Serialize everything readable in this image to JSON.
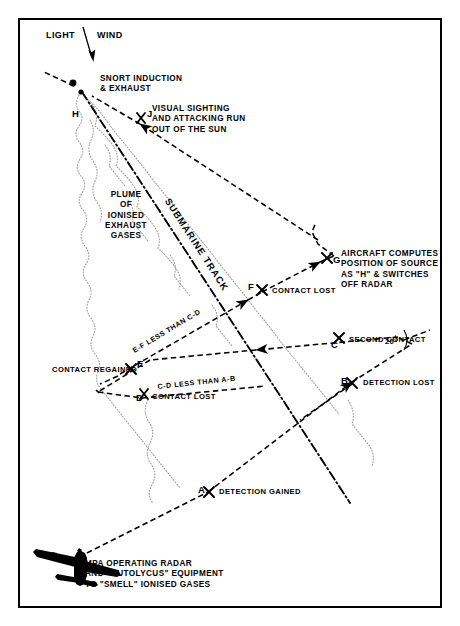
{
  "diagram": {
    "title_visible": false,
    "frame": {
      "stroke": "#000000"
    },
    "wind": {
      "left_word": "LIGHT",
      "right_word": "WIND",
      "arrow": "down-arrow-icon"
    },
    "labels": {
      "snort": "SNORT INDUCTION\n& EXHAUST",
      "visual_sighting": "VISUAL SIGHTING\nAND ATTACKING RUN\nOUT OF THE SUN",
      "plume": "PLUME\nOF\nIONISED\nEXHAUST\nGASES",
      "submarine_track": "SUBMARINE TRACK",
      "aircraft_computes": "AIRCRAFT COMPUTES\nPOSITION OF SOURCE\nAS \"H\" & SWITCHES\nOFF RADAR",
      "ef_less": "E-F LESS THAN C-D",
      "cd_less": "C-D LESS THAN A-B",
      "angle": "20°",
      "mpa": "MPA OPERATING RADAR\nAND \"AUTOLYCUS\" EQUIPMENT\nTO \"SMELL\" IONISED GASES"
    },
    "points": [
      {
        "id": "A",
        "label": "A",
        "event": "DETECTION GAINED"
      },
      {
        "id": "B",
        "label": "B",
        "event": "DETECTION LOST"
      },
      {
        "id": "C",
        "label": "C",
        "event": "SECOND CONTACT"
      },
      {
        "id": "D",
        "label": "D",
        "event": "CONTACT LOST"
      },
      {
        "id": "E",
        "label": "E",
        "event": "CONTACT REGAINED"
      },
      {
        "id": "F",
        "label": "F",
        "event": "CONTACT LOST"
      },
      {
        "id": "G",
        "label": "G",
        "event": ""
      },
      {
        "id": "H",
        "label": "H",
        "event": ""
      },
      {
        "id": "J",
        "label": "J",
        "event": ""
      }
    ],
    "aircraft_icon": "maritime-patrol-aircraft-icon",
    "colors": {
      "ink": "#000000",
      "paper": "#ffffff",
      "plume": "#8a8a8a"
    }
  }
}
